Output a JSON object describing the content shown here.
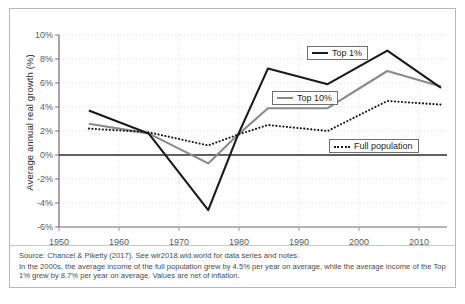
{
  "chart_data": {
    "type": "line",
    "title": "",
    "xlabel": "",
    "ylabel": "Average annual real growth (%)",
    "xlim": [
      1950,
      2015
    ],
    "ylim": [
      -6,
      10
    ],
    "grid": true,
    "legend_position": "inside-plot",
    "x": [
      1955,
      1965,
      1975,
      1980,
      1985,
      1995,
      2005,
      2014
    ],
    "xtick_labels": [
      "1950",
      "1960",
      "1970",
      "1980",
      "1990",
      "2000",
      "2010"
    ],
    "xticks": [
      1950,
      1960,
      1970,
      1980,
      1990,
      2000,
      2010
    ],
    "ytick_labels": [
      "10%",
      "8%",
      "6%",
      "4%",
      "2%",
      "0%",
      "-2%",
      "-4%",
      "-6%"
    ],
    "yticks": [
      10,
      8,
      6,
      4,
      2,
      0,
      -2,
      -4,
      -6
    ],
    "series": [
      {
        "name": "Top 1%",
        "style": "solid",
        "color": "#1a1a1a",
        "values": [
          3.7,
          1.8,
          -4.6,
          1.7,
          7.2,
          5.9,
          8.7,
          5.6
        ]
      },
      {
        "name": "Top 10%",
        "style": "solid",
        "color": "#8a8a8a",
        "values": [
          2.6,
          1.8,
          -0.7,
          1.7,
          3.9,
          3.9,
          7.0,
          5.7
        ]
      },
      {
        "name": "Full population",
        "style": "dotted",
        "color": "#1a1a1a",
        "values": [
          2.2,
          1.9,
          0.8,
          1.7,
          2.5,
          2.0,
          4.5,
          4.2
        ]
      }
    ],
    "annotations": []
  },
  "legend": {
    "items": [
      {
        "label": "Top 1%",
        "swatch": "solid-dark"
      },
      {
        "label": "Top 10%",
        "swatch": "solid-gray"
      },
      {
        "label": "Full population",
        "swatch": "dotted"
      }
    ]
  },
  "footer": {
    "source_line": "Source: Chancel & Piketty (2017). See wir2018.wid.world for data series and notes.",
    "note_line": "In the 2000s, the average income of the full population grew by 4.5% per year on average, while the average income of the Top 1% grew by 8.7% per year on average. Values are net of inflation."
  }
}
